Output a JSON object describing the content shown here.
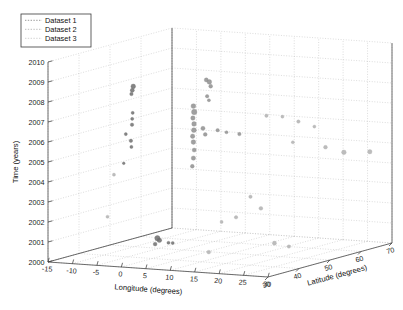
{
  "figure": {
    "kind": "matlab-3d-scatter",
    "background": "#ffffff",
    "axis_color": "#3d3d3d",
    "grid_color": "#b9b9b9"
  },
  "legend": {
    "position": "top-left",
    "entries": [
      {
        "label": "Dataset 1",
        "color": "#9a9a9a",
        "marker": "dot"
      },
      {
        "label": "Dataset 2",
        "color": "#bdbdbd",
        "marker": "dot"
      },
      {
        "label": "Dataset 3",
        "color": "#d2d2d2",
        "marker": "dot"
      }
    ]
  },
  "chart_data": {
    "type": "scatter",
    "projection": "3d",
    "title": "",
    "xlabel": "Longitude (degrees)",
    "ylabel": "Latitude (degrees)",
    "zlabel": "Time (years)",
    "xlim": [
      -15,
      30
    ],
    "ylim": [
      30,
      70
    ],
    "zlim": [
      2000,
      2010
    ],
    "xticks": [
      -15,
      -10,
      -5,
      0,
      5,
      10,
      15,
      20,
      25,
      30
    ],
    "yticks": [
      30,
      40,
      50,
      60,
      70
    ],
    "zticks": [
      2000,
      2001,
      2002,
      2003,
      2004,
      2005,
      2006,
      2007,
      2008,
      2009,
      2010
    ],
    "xtick_labels": [
      "-15",
      "-10",
      "-5",
      "0",
      "5",
      "10",
      "15",
      "20",
      "25",
      "30"
    ],
    "ytick_labels": [
      "30",
      "40",
      "50",
      "60",
      "70"
    ],
    "ztick_labels": [
      "2000",
      "2001",
      "2002",
      "2003",
      "2004",
      "2005",
      "2006",
      "2007",
      "2008",
      "2009",
      "2010"
    ],
    "grid": true,
    "legend_position": "upper left",
    "series": [
      {
        "name": "Dataset 1",
        "color": "#6e6e6e",
        "points": [
          {
            "lon": -2.0,
            "lat": 37.0,
            "t": 2008.7,
            "s": 9
          },
          {
            "lon": -2.2,
            "lat": 37.0,
            "t": 2008.5,
            "s": 7
          },
          {
            "lon": -2.5,
            "lat": 37.2,
            "t": 2008.3,
            "s": 5
          },
          {
            "lon": -1.8,
            "lat": 36.5,
            "t": 2007.4,
            "s": 4
          },
          {
            "lon": -1.9,
            "lat": 36.5,
            "t": 2007.1,
            "s": 4
          },
          {
            "lon": -2.0,
            "lat": 36.6,
            "t": 2006.8,
            "s": 5
          },
          {
            "lon": -3.4,
            "lat": 36.8,
            "t": 2006.3,
            "s": 4
          },
          {
            "lon": -2.1,
            "lat": 36.4,
            "t": 2006.0,
            "s": 5
          },
          {
            "lon": -2.0,
            "lat": 36.4,
            "t": 2005.7,
            "s": 4
          },
          {
            "lon": -4.2,
            "lat": 37.4,
            "t": 2004.8,
            "s": 3
          },
          {
            "lon": 3.0,
            "lat": 36.9,
            "t": 2001.2,
            "s": 11
          },
          {
            "lon": 3.4,
            "lat": 36.9,
            "t": 2001.1,
            "s": 9
          },
          {
            "lon": 5.2,
            "lat": 37.0,
            "t": 2001.0,
            "s": 4
          },
          {
            "lon": 6.0,
            "lat": 37.1,
            "t": 2001.0,
            "s": 4
          },
          {
            "lon": 2.6,
            "lat": 36.8,
            "t": 2000.9,
            "s": 6
          }
        ]
      },
      {
        "name": "Dataset 2",
        "color": "#8f8f8f",
        "points": [
          {
            "lon": 8.5,
            "lat": 44.0,
            "t": 2008.9,
            "s": 7
          },
          {
            "lon": 9.0,
            "lat": 44.2,
            "t": 2008.8,
            "s": 9
          },
          {
            "lon": 9.4,
            "lat": 44.0,
            "t": 2008.6,
            "s": 6
          },
          {
            "lon": 8.8,
            "lat": 43.8,
            "t": 2008.1,
            "s": 5
          },
          {
            "lon": 9.1,
            "lat": 43.9,
            "t": 2007.9,
            "s": 4
          },
          {
            "lon": 6.5,
            "lat": 43.0,
            "t": 2007.6,
            "s": 10
          },
          {
            "lon": 6.6,
            "lat": 43.1,
            "t": 2007.3,
            "s": 12
          },
          {
            "lon": 6.4,
            "lat": 43.0,
            "t": 2007.0,
            "s": 8
          },
          {
            "lon": 6.5,
            "lat": 43.2,
            "t": 2006.7,
            "s": 9
          },
          {
            "lon": 6.6,
            "lat": 43.0,
            "t": 2006.4,
            "s": 10
          },
          {
            "lon": 6.4,
            "lat": 42.9,
            "t": 2006.1,
            "s": 8
          },
          {
            "lon": 6.5,
            "lat": 43.0,
            "t": 2005.8,
            "s": 9
          },
          {
            "lon": 6.6,
            "lat": 43.1,
            "t": 2005.4,
            "s": 7
          },
          {
            "lon": 6.5,
            "lat": 43.0,
            "t": 2005.0,
            "s": 8
          },
          {
            "lon": 6.4,
            "lat": 42.8,
            "t": 2004.6,
            "s": 6
          },
          {
            "lon": 8.2,
            "lat": 43.4,
            "t": 2006.5,
            "s": 7
          },
          {
            "lon": 8.6,
            "lat": 43.5,
            "t": 2006.2,
            "s": 6
          },
          {
            "lon": 10.5,
            "lat": 44.5,
            "t": 2006.4,
            "s": 5
          },
          {
            "lon": 12.0,
            "lat": 45.0,
            "t": 2006.3,
            "s": 4
          },
          {
            "lon": 14.0,
            "lat": 46.0,
            "t": 2006.2,
            "s": 5
          }
        ]
      },
      {
        "name": "Dataset 3",
        "color": "#b0b0b0",
        "points": [
          {
            "lon": 17.0,
            "lat": 50.0,
            "t": 2007.0,
            "s": 5
          },
          {
            "lon": 19.0,
            "lat": 52.0,
            "t": 2006.9,
            "s": 4
          },
          {
            "lon": 21.0,
            "lat": 54.0,
            "t": 2006.6,
            "s": 5
          },
          {
            "lon": 23.0,
            "lat": 56.0,
            "t": 2006.3,
            "s": 4
          },
          {
            "lon": 20.5,
            "lat": 53.0,
            "t": 2005.6,
            "s": 4
          },
          {
            "lon": 24.0,
            "lat": 58.0,
            "t": 2005.2,
            "s": 6
          },
          {
            "lon": 26.5,
            "lat": 60.0,
            "t": 2004.9,
            "s": 9
          },
          {
            "lon": 28.0,
            "lat": 66.0,
            "t": 2004.7,
            "s": 8
          },
          {
            "lon": 15.0,
            "lat": 48.0,
            "t": 2003.0,
            "s": 5
          },
          {
            "lon": 16.5,
            "lat": 49.0,
            "t": 2002.4,
            "s": 6
          },
          {
            "lon": 13.0,
            "lat": 46.5,
            "t": 2002.0,
            "s": 5
          },
          {
            "lon": 11.0,
            "lat": 45.0,
            "t": 2001.8,
            "s": 4
          },
          {
            "lon": 18.0,
            "lat": 51.0,
            "t": 2000.6,
            "s": 7
          },
          {
            "lon": 20.0,
            "lat": 52.5,
            "t": 2000.4,
            "s": 5
          },
          {
            "lon": 9.0,
            "lat": 44.0,
            "t": 2000.3,
            "s": 6
          },
          {
            "lon": -6.0,
            "lat": 35.0,
            "t": 2002.2,
            "s": 4
          },
          {
            "lon": -5.0,
            "lat": 35.5,
            "t": 2004.3,
            "s": 4
          }
        ]
      }
    ]
  }
}
